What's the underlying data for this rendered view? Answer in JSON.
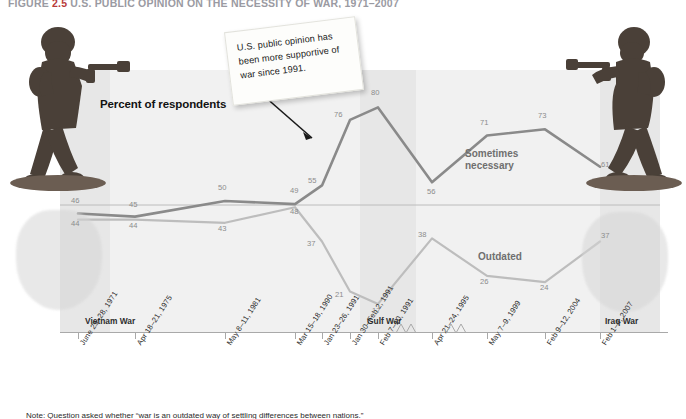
{
  "figure": {
    "number": "2.5",
    "label_prefix": "FIGURE",
    "title": "U.S. PUBLIC OPINION ON THE NECESSITY OF WAR, 1971–2007"
  },
  "callout": {
    "text": "U.S. public opinion has been more supportive of war since 1991."
  },
  "axis": {
    "y_title": "Percent of respondents",
    "x_labels": [
      "June 25–28, 1971",
      "Apr 18–21, 1975",
      "May 8–11, 1981",
      "Mar 15–18, 1990",
      "Jan 23–26, 1991",
      "Jan 30–Feb 2, 1991",
      "Feb 7–10, 1991",
      "Apr 21–24, 1995",
      "May 7–9, 1999",
      "Feb 9–12, 2004",
      "Feb 1–4, 2007"
    ]
  },
  "bands": [
    {
      "label": "Vietnam War"
    },
    {
      "label": "Gulf War"
    },
    {
      "label": "Iraq War"
    }
  ],
  "series_labels": {
    "necessary_line1": "Sometimes",
    "necessary_line2": "necessary",
    "outdated": "Outdated"
  },
  "colors": {
    "necessary": "#8a8a8a",
    "outdated": "#bdbdbd",
    "band": "#dedede",
    "axis": "#a9a9a9",
    "value_label": "#8c8c8c",
    "fignum": "#b83b3b"
  },
  "caption": {
    "text": "Note: Question asked whether “war is an outdated way of settling differences between nations.”"
  },
  "chart_data": {
    "type": "line",
    "title": "U.S. PUBLIC OPINION ON THE NECESSITY OF WAR, 1971–2007",
    "xlabel": "",
    "ylabel": "Percent of respondents",
    "ylim": [
      0,
      100
    ],
    "grid": false,
    "legend": "inline",
    "axis_break_after": [
      6,
      7
    ],
    "categories": [
      "June 25–28, 1971",
      "Apr 18–21, 1975",
      "May 8–11, 1981",
      "Mar 15–18, 1990",
      "Jan 23–26, 1991",
      "Jan 30–Feb 2, 1991",
      "Feb 7–10, 1991",
      "Apr 21–24, 1995",
      "May 7–9, 1999",
      "Feb 9–12, 2004",
      "Feb 1–4, 2007"
    ],
    "series": [
      {
        "name": "Sometimes necessary",
        "color": "#8a8a8a",
        "values": [
          46,
          45,
          50,
          49,
          55,
          76,
          80,
          56,
          71,
          73,
          61
        ]
      },
      {
        "name": "Outdated",
        "color": "#bdbdbd",
        "values": [
          44,
          44,
          43,
          48,
          37,
          21,
          17,
          38,
          26,
          24,
          37
        ]
      }
    ],
    "annotations": [
      {
        "text": "U.S. public opinion has been more supportive of war since 1991.",
        "points_to": "Jan 30–Feb 2, 1991"
      }
    ],
    "shaded_regions": [
      {
        "label": "Vietnam War",
        "from": "June 25–28, 1971",
        "to": "Apr 18–21, 1975"
      },
      {
        "label": "Gulf War",
        "from": "Jan 23–26, 1991",
        "to": "Feb 7–10, 1991"
      },
      {
        "label": "Iraq War",
        "from": "Feb 9–12, 2004",
        "to": "Feb 1–4, 2007"
      }
    ]
  }
}
